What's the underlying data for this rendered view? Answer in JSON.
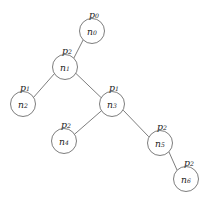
{
  "diagram": {
    "type": "tree-graph",
    "title": "",
    "canvas": {
      "width": 213,
      "height": 204
    },
    "style": {
      "background_color": "#ffffff",
      "node_fill": "#ffffff",
      "node_stroke": "#6e6e6e",
      "edge_stroke": "#6e6e6e",
      "text_color": "#1c1c1c"
    },
    "nodes": [
      {
        "id": "n0",
        "name_base": "n",
        "name_sub": "0",
        "p_base": "p",
        "p_sub": "0",
        "cx": 92,
        "cy": 31,
        "r": 12.5,
        "px": 94,
        "py": 14
      },
      {
        "id": "n1",
        "name_base": "n",
        "name_sub": "1",
        "p_base": "p",
        "p_sub": "2",
        "cx": 65,
        "cy": 67,
        "r": 12.5,
        "px": 67,
        "py": 50
      },
      {
        "id": "n2",
        "name_base": "n",
        "name_sub": "2",
        "p_base": "p",
        "p_sub": "1",
        "cx": 23,
        "cy": 104,
        "r": 12.5,
        "px": 25,
        "py": 87
      },
      {
        "id": "n3",
        "name_base": "n",
        "name_sub": "3",
        "p_base": "p",
        "p_sub": "1",
        "cx": 112,
        "cy": 104,
        "r": 12.5,
        "px": 114,
        "py": 87
      },
      {
        "id": "n4",
        "name_base": "n",
        "name_sub": "4",
        "p_base": "p",
        "p_sub": "2",
        "cx": 64,
        "cy": 141,
        "r": 12.5,
        "px": 66,
        "py": 124
      },
      {
        "id": "n5",
        "name_base": "n",
        "name_sub": "5",
        "p_base": "p",
        "p_sub": "2",
        "cx": 160,
        "cy": 143,
        "r": 12.5,
        "px": 162,
        "py": 126
      },
      {
        "id": "n6",
        "name_base": "n",
        "name_sub": "6",
        "p_base": "p",
        "p_sub": "2",
        "cx": 186,
        "cy": 179,
        "r": 12.5,
        "px": 189,
        "py": 162
      }
    ],
    "edges": [
      {
        "id": "edge-n0-n1",
        "from": "n0",
        "to": "n1",
        "x1": 83.2,
        "y1": 39.8,
        "x2": 73.8,
        "y2": 58.2
      },
      {
        "id": "edge-n1-n2",
        "from": "n1",
        "to": "n2",
        "x1": 54.2,
        "y1": 73.9,
        "x2": 33.8,
        "y2": 97.1
      },
      {
        "id": "edge-n1-n3",
        "from": "n1",
        "to": "n3",
        "x1": 76.0,
        "y1": 73.5,
        "x2": 101.0,
        "y2": 97.5
      },
      {
        "id": "edge-n3-n4",
        "from": "n3",
        "to": "n4",
        "x1": 101.2,
        "y1": 111.0,
        "x2": 74.8,
        "y2": 134.0
      },
      {
        "id": "edge-n3-n5",
        "from": "n3",
        "to": "n5",
        "x1": 123.5,
        "y1": 110.5,
        "x2": 148.5,
        "y2": 136.5
      },
      {
        "id": "edge-n5-n6",
        "from": "n5",
        "to": "n6",
        "x1": 169.0,
        "y1": 152.0,
        "x2": 177.0,
        "y2": 170.0
      }
    ]
  }
}
